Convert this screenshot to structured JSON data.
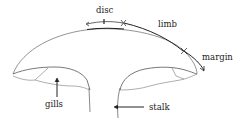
{
  "diagram": {
    "labels": {
      "disc": "disc",
      "limb": "limb",
      "margin": "margin",
      "gills": "gills",
      "stalk": "stalk"
    },
    "colors": {
      "line": "#555555",
      "heavy": "#222222",
      "background": "#ffffff"
    }
  }
}
